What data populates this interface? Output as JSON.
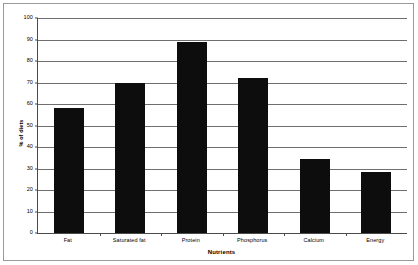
{
  "chart_data": {
    "type": "bar",
    "title": "",
    "categories": [
      "Fat",
      "Saturated fat",
      "Protein",
      "Phosphorus",
      "Calcium",
      "Energy"
    ],
    "values": [
      58,
      70,
      89,
      72,
      34.5,
      28.5
    ],
    "xlabel": "Nutrients",
    "ylabel": "% of diets",
    "ylim": [
      0,
      100
    ],
    "ytick_step": 10,
    "yticks": [
      0,
      10,
      20,
      30,
      40,
      50,
      60,
      70,
      80,
      90,
      100
    ],
    "ytick_labels": [
      "0",
      "10",
      "20",
      "30",
      "40",
      "50",
      "60",
      "70",
      "80",
      "90",
      "100"
    ],
    "grid": true,
    "legend": false,
    "bar_color": "#0d0d0d",
    "grid_color": "#6f6f6f",
    "axis_color": "#4a4a4a",
    "background_color": "#ffffff"
  }
}
